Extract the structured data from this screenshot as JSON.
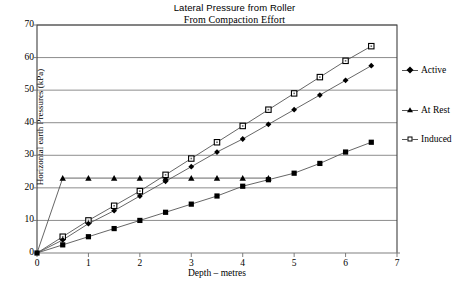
{
  "chart_data": {
    "type": "line",
    "title": "Lateral Pressure from Roller",
    "subtitle": "From Compaction Effort",
    "xlabel": "Depth – metres",
    "ylabel": "Horizontal earth Pressures  (kPa)",
    "xlim": [
      0,
      7
    ],
    "ylim": [
      0,
      70
    ],
    "xticks": [
      0,
      1,
      2,
      3,
      4,
      5,
      6,
      7
    ],
    "yticks": [
      0,
      10,
      20,
      30,
      40,
      50,
      60,
      70
    ],
    "grid": "horizontal",
    "legend_position": "right",
    "series": [
      {
        "name": "Active",
        "marker": "filled-square",
        "x": [
          0,
          0.5,
          1.0,
          1.5,
          2.0,
          2.5,
          3.0,
          3.5,
          4.0,
          4.5,
          5.0,
          5.5,
          6.0,
          6.5
        ],
        "y": [
          0,
          2.5,
          5.0,
          7.5,
          10.0,
          12.5,
          15.0,
          17.5,
          20.5,
          22.5,
          24.5,
          27.5,
          31.0,
          34.0
        ]
      },
      {
        "name": "At Rest",
        "marker": "filled-triangle",
        "x": [
          0,
          0.5,
          1.0,
          1.5,
          2.0,
          2.5,
          3.0,
          3.5,
          4.0,
          4.5
        ],
        "y": [
          0,
          23.0,
          23.0,
          23.0,
          23.0,
          23.0,
          23.0,
          23.0,
          23.0,
          23.0
        ]
      },
      {
        "name": "Induced",
        "marker": "open-square",
        "x": [
          0,
          0.5,
          1.0,
          1.5,
          2.0,
          2.5,
          3.0,
          3.5,
          4.0,
          4.5,
          5.0,
          5.5,
          6.0,
          6.5
        ],
        "y": [
          0,
          5.0,
          10.0,
          14.5,
          19.0,
          24.0,
          29.0,
          34.0,
          39.0,
          44.0,
          49.0,
          54.0,
          59.0,
          63.5
        ]
      },
      {
        "name": "Active-upper",
        "marker": "filled-diamond",
        "x": [
          0,
          0.5,
          1.0,
          1.5,
          2.0,
          2.5,
          3.0,
          3.5,
          4.0,
          4.5,
          5.0,
          5.5,
          6.0,
          6.5
        ],
        "y": [
          0,
          4.0,
          9.0,
          13.0,
          17.5,
          22.0,
          26.5,
          31.0,
          35.0,
          39.5,
          44.0,
          48.5,
          53.0,
          57.5
        ]
      }
    ]
  },
  "legend": {
    "items": [
      {
        "label": "Active",
        "marker": "filled-diamond"
      },
      {
        "label": "At Rest",
        "marker": "filled-triangle"
      },
      {
        "label": "Induced",
        "marker": "open-square"
      }
    ]
  }
}
